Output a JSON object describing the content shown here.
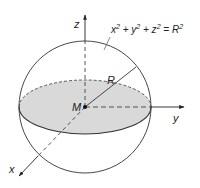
{
  "diagram": {
    "equation": {
      "parts": [
        "x",
        "2",
        " + y",
        "2",
        " + z",
        "2",
        " = R",
        "2"
      ]
    },
    "labels": {
      "z_axis": "z",
      "y_axis": "y",
      "x_axis": "x",
      "radius": "R",
      "center": "M"
    },
    "colors": {
      "stroke": "#333333",
      "equator_fill": "#d9d9d9",
      "background": "#ffffff"
    }
  }
}
